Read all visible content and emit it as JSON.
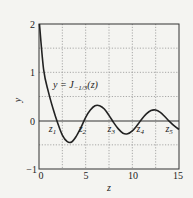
{
  "chart_data": {
    "type": "line",
    "title": "",
    "xlabel": "z",
    "ylabel": "y",
    "xlim": [
      0,
      15
    ],
    "ylim": [
      -1,
      2
    ],
    "xticks": [
      0,
      5,
      10,
      15
    ],
    "yticks": [
      -1,
      0,
      1,
      2
    ],
    "grid": true,
    "series": [
      {
        "name": "y = J_{-1/3}(z)",
        "x": [
          0.05,
          0.5,
          1.0,
          1.5,
          2.0,
          2.5,
          3.0,
          3.5,
          4.0,
          4.5,
          5.0,
          5.5,
          6.0,
          6.5,
          7.0,
          7.5,
          8.0,
          8.5,
          9.0,
          9.5,
          10.0,
          10.5,
          11.0,
          11.5,
          12.0,
          12.5,
          13.0,
          13.5,
          14.0,
          14.5,
          15.0
        ],
        "y": [
          2.0,
          1.05,
          0.6,
          0.25,
          -0.05,
          -0.3,
          -0.43,
          -0.44,
          -0.32,
          -0.14,
          0.07,
          0.22,
          0.31,
          0.31,
          0.24,
          0.11,
          -0.04,
          -0.17,
          -0.26,
          -0.27,
          -0.21,
          -0.1,
          0.03,
          0.14,
          0.21,
          0.22,
          0.17,
          0.08,
          -0.02,
          -0.11,
          -0.18
        ]
      }
    ],
    "annotations": [
      {
        "text": "y = J_{-1/3}(z)",
        "x": 2.2,
        "y": 0.85
      },
      {
        "text": "z1",
        "x": 1.8,
        "y": -0.15
      },
      {
        "text": "z2",
        "x": 5.0,
        "y": -0.15
      },
      {
        "text": "z3",
        "x": 8.1,
        "y": -0.15
      },
      {
        "text": "z4",
        "x": 11.2,
        "y": -0.15
      },
      {
        "text": "z5",
        "x": 14.3,
        "y": -0.15
      }
    ]
  },
  "labels": {
    "xlabel": "z",
    "ylabel": "y",
    "curve": "y = J",
    "curve_sub": "−1/3",
    "curve_arg": "(z)",
    "xticks": [
      "0",
      "5",
      "10",
      "15"
    ],
    "yticks": [
      "2",
      "1",
      "0",
      "−1"
    ],
    "zeros": [
      "z",
      "z",
      "z",
      "z",
      "z"
    ],
    "zero_subs": [
      "1",
      "2",
      "3",
      "4",
      "5"
    ]
  }
}
